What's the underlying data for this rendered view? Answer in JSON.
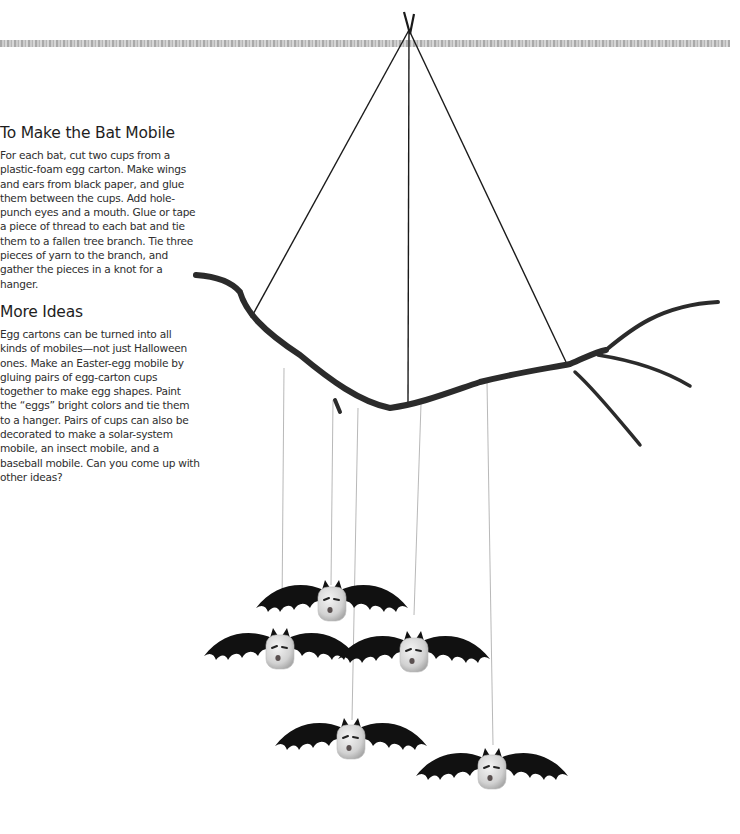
{
  "sections": [
    {
      "heading": "To Make the Bat Mobile",
      "body": "For each bat, cut two cups from a plastic-foam egg carton. Make wings and ears from black paper, and glue them between the cups. Add hole-punch eyes and a mouth. Glue or tape a piece of thread to each bat and tie them to a fallen tree branch. Tie three pieces of yarn to the branch, and gather the pieces in a knot for a hanger."
    },
    {
      "heading": "More Ideas",
      "body": "Egg cartons can be turned into all kinds of mobiles—not just Halloween ones. Make an Easter-egg mobile by gluing pairs of egg-carton cups together to make egg shapes. Paint the “eggs” bright colors and tie them to a hanger. Pairs of cups can also be decorated to make a solar-system mobile, an insect mobile, and a baseball mobile. Can you come up with other ideas?"
    }
  ],
  "illustration": {
    "subject": "bat-mobile",
    "bat_count": 5,
    "colors": {
      "wing": "#111111",
      "cup": "#d8d8d8",
      "branch": "#2b2b2b",
      "ceiling": "#a8a8a8"
    }
  }
}
